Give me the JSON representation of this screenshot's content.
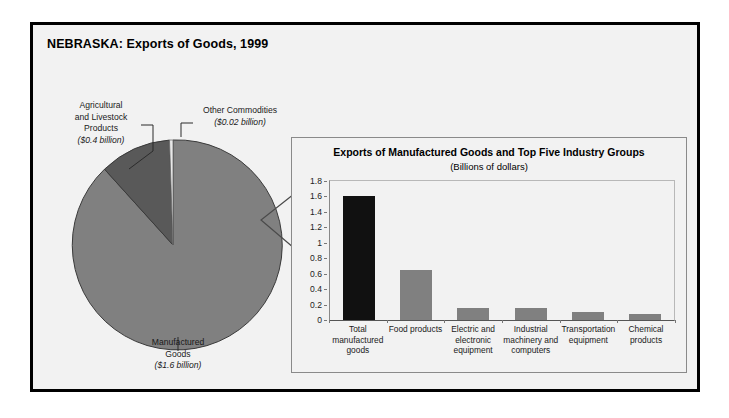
{
  "figure": {
    "title": "NEBRASKA: Exports of Goods, 1999"
  },
  "colors": {
    "frame_border": "#000000",
    "panel_background": "#f2f2f2",
    "pie_manufactured": "#808080",
    "pie_agricultural": "#595959",
    "pie_other": "#e8e8e8",
    "bar_default": "#808080",
    "bar_highlight": "#111111"
  },
  "pie": {
    "labels": {
      "agricultural": {
        "name": "Agricultural and Livestock Products",
        "line1": "Agricultural",
        "line2": "and Livestock",
        "line3": "Products",
        "value": "($0.4 billion)"
      },
      "other": {
        "name": "Other Commodities",
        "line1": "Other Commodities",
        "value": "($0.02 billion)"
      },
      "manufactured": {
        "name": "Manufactured Goods",
        "line1": "Manufactured",
        "line2": "Goods",
        "value": "($1.6 billion)"
      }
    }
  },
  "inset": {
    "title": "Exports of Manufactured Goods and Top Five Industry Groups",
    "subtitle": "(Billions of dollars)"
  },
  "chart_data": [
    {
      "type": "pie",
      "title": "NEBRASKA: Exports of Goods, 1999",
      "unit": "billions of dollars",
      "labels": [
        "Manufactured Goods",
        "Agricultural and Livestock Products",
        "Other Commodities"
      ],
      "values": [
        1.6,
        0.4,
        0.02
      ],
      "value_labels": [
        "($1.6 billion)",
        "($0.4 billion)",
        "($0.02 billion)"
      ],
      "colors": [
        "#808080",
        "#595959",
        "#e8e8e8"
      ],
      "legend": "none",
      "start_angle_deg": 0,
      "direction": "counterclockwise"
    },
    {
      "type": "bar",
      "title": "Exports of Manufactured Goods and Top Five Industry Groups",
      "subtitle": "(Billions of dollars)",
      "categories": [
        "Total manufactured goods",
        "Food products",
        "Electric and electronic equipment",
        "Industrial machinery and computers",
        "Transportation equipment",
        "Chemical products"
      ],
      "values": [
        1.61,
        0.65,
        0.16,
        0.15,
        0.1,
        0.08
      ],
      "xlabel": "",
      "ylabel": "",
      "ylim": [
        0,
        1.8
      ],
      "yticks": [
        0,
        0.2,
        0.4,
        0.6,
        0.8,
        1,
        1.2,
        1.4,
        1.6,
        1.8
      ],
      "ytick_labels": [
        "0",
        "0.2",
        "0.4",
        "0.6",
        "0.8",
        "1",
        "1.2",
        "1.4",
        "1.6",
        "1.8"
      ],
      "grid": false,
      "legend": "none",
      "highlight_index": 0
    }
  ]
}
